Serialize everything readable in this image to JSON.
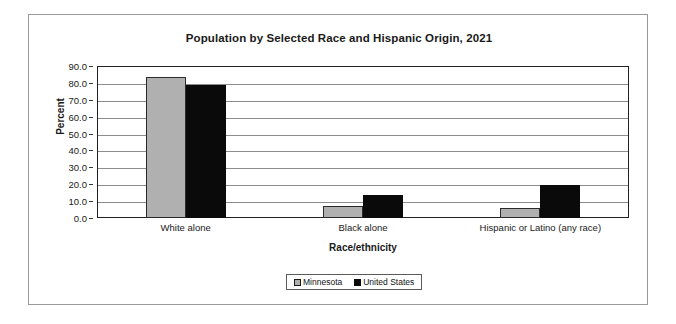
{
  "chart_data": {
    "type": "bar",
    "title": "Population by Selected Race and Hispanic Origin, 2021",
    "xlabel": "Race/ethnicity",
    "ylabel": "Percent",
    "categories": [
      "White alone",
      "Black alone",
      "Hispanic or Latino (any race)"
    ],
    "series": [
      {
        "name": "Minnesota",
        "color": "#b0b0b0",
        "values": [
          83.5,
          7.0,
          6.0
        ]
      },
      {
        "name": "United States",
        "color": "#0a0a0a",
        "values": [
          78.5,
          13.5,
          19.5
        ]
      }
    ],
    "ylim": [
      0.0,
      90.0
    ],
    "ytick_step": 10.0,
    "ytick_labels": [
      "90.0",
      "80.0",
      "70.0",
      "60.0",
      "50.0",
      "40.0",
      "30.0",
      "20.0",
      "10.0",
      "0.0"
    ],
    "grid": true,
    "legend_position": "bottom-center"
  },
  "legend": {
    "entries": [
      {
        "label": "Minnesota"
      },
      {
        "label": "United States"
      }
    ]
  }
}
